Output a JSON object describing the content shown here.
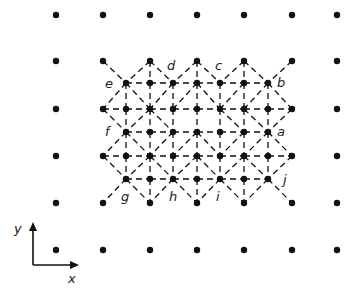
{
  "figure": {
    "width": 353,
    "height": 292,
    "colors": {
      "ink": "#111111",
      "background": "#ffffff"
    },
    "dot_radius": 3.2,
    "outer_lattice": {
      "columns": [
        56,
        103,
        150,
        197,
        244,
        292,
        337
      ],
      "rows": [
        15,
        61,
        109,
        156,
        203,
        250
      ],
      "excluded": [
        [
          150,
          109
        ],
        [
          197,
          109
        ],
        [
          244,
          109
        ],
        [
          150,
          156
        ],
        [
          197,
          156
        ],
        [
          244,
          156
        ]
      ]
    },
    "inner_lattice": {
      "rows": [
        {
          "y": 83,
          "xs": [
            126,
            150,
            173,
            197,
            220,
            244,
            268
          ]
        },
        {
          "y": 109,
          "xs": [
            126,
            150,
            173,
            197,
            220,
            244,
            268
          ]
        },
        {
          "y": 132,
          "xs": [
            126,
            150,
            173,
            197,
            220,
            244,
            268
          ]
        },
        {
          "y": 156,
          "xs": [
            126,
            150,
            173,
            197,
            220,
            244,
            268
          ]
        },
        {
          "y": 179,
          "xs": [
            126,
            150,
            173,
            197,
            220,
            244,
            268
          ]
        }
      ]
    },
    "edges": [
      [
        103,
        61,
        126,
        83
      ],
      [
        150,
        61,
        126,
        83
      ],
      [
        150,
        61,
        150,
        83
      ],
      [
        150,
        61,
        173,
        83
      ],
      [
        197,
        61,
        173,
        83
      ],
      [
        197,
        61,
        197,
        83
      ],
      [
        197,
        61,
        220,
        83
      ],
      [
        244,
        61,
        220,
        83
      ],
      [
        244,
        61,
        244,
        83
      ],
      [
        244,
        61,
        268,
        83
      ],
      [
        292,
        61,
        268,
        83
      ],
      [
        126,
        83,
        150,
        83
      ],
      [
        150,
        83,
        173,
        83
      ],
      [
        173,
        83,
        197,
        83
      ],
      [
        197,
        83,
        220,
        83
      ],
      [
        220,
        83,
        244,
        83
      ],
      [
        244,
        83,
        268,
        83
      ],
      [
        103,
        109,
        126,
        109
      ],
      [
        126,
        109,
        150,
        109
      ],
      [
        150,
        109,
        173,
        109
      ],
      [
        173,
        109,
        197,
        109
      ],
      [
        197,
        109,
        220,
        109
      ],
      [
        220,
        109,
        244,
        109
      ],
      [
        244,
        109,
        268,
        109
      ],
      [
        268,
        109,
        292,
        109
      ],
      [
        126,
        132,
        150,
        132
      ],
      [
        150,
        132,
        173,
        132
      ],
      [
        173,
        132,
        197,
        132
      ],
      [
        197,
        132,
        220,
        132
      ],
      [
        220,
        132,
        244,
        132
      ],
      [
        244,
        132,
        268,
        132
      ],
      [
        103,
        156,
        126,
        156
      ],
      [
        126,
        156,
        150,
        156
      ],
      [
        150,
        156,
        173,
        156
      ],
      [
        173,
        156,
        197,
        156
      ],
      [
        197,
        156,
        220,
        156
      ],
      [
        220,
        156,
        244,
        156
      ],
      [
        244,
        156,
        268,
        156
      ],
      [
        268,
        156,
        292,
        156
      ],
      [
        126,
        179,
        150,
        179
      ],
      [
        150,
        179,
        173,
        179
      ],
      [
        173,
        179,
        197,
        179
      ],
      [
        197,
        179,
        220,
        179
      ],
      [
        220,
        179,
        244,
        179
      ],
      [
        244,
        179,
        268,
        179
      ],
      [
        126,
        83,
        126,
        109
      ],
      [
        150,
        83,
        150,
        109
      ],
      [
        173,
        83,
        173,
        109
      ],
      [
        197,
        83,
        197,
        109
      ],
      [
        220,
        83,
        220,
        109
      ],
      [
        244,
        83,
        244,
        109
      ],
      [
        268,
        83,
        268,
        109
      ],
      [
        126,
        109,
        126,
        132
      ],
      [
        150,
        109,
        150,
        132
      ],
      [
        173,
        109,
        173,
        132
      ],
      [
        197,
        109,
        197,
        132
      ],
      [
        220,
        109,
        220,
        132
      ],
      [
        244,
        109,
        244,
        132
      ],
      [
        268,
        109,
        268,
        132
      ],
      [
        126,
        132,
        126,
        156
      ],
      [
        150,
        132,
        150,
        156
      ],
      [
        173,
        132,
        173,
        156
      ],
      [
        197,
        132,
        197,
        156
      ],
      [
        220,
        132,
        220,
        156
      ],
      [
        244,
        132,
        244,
        156
      ],
      [
        268,
        132,
        268,
        156
      ],
      [
        126,
        156,
        126,
        179
      ],
      [
        150,
        156,
        150,
        179
      ],
      [
        173,
        156,
        173,
        179
      ],
      [
        197,
        156,
        197,
        179
      ],
      [
        220,
        156,
        220,
        179
      ],
      [
        244,
        156,
        244,
        179
      ],
      [
        268,
        156,
        268,
        179
      ],
      [
        150,
        179,
        150,
        203
      ],
      [
        197,
        179,
        197,
        203
      ],
      [
        244,
        179,
        244,
        203
      ],
      [
        126,
        83,
        103,
        109
      ],
      [
        126,
        83,
        150,
        109
      ],
      [
        173,
        83,
        150,
        109
      ],
      [
        197,
        83,
        173,
        109
      ],
      [
        197,
        83,
        220,
        109
      ],
      [
        244,
        83,
        220,
        109
      ],
      [
        268,
        83,
        244,
        109
      ],
      [
        268,
        83,
        292,
        109
      ],
      [
        103,
        109,
        126,
        132
      ],
      [
        150,
        109,
        126,
        132
      ],
      [
        150,
        109,
        173,
        132
      ],
      [
        244,
        109,
        268,
        132
      ],
      [
        292,
        109,
        268,
        132
      ],
      [
        220,
        109,
        244,
        132
      ],
      [
        126,
        132,
        103,
        156
      ],
      [
        126,
        132,
        150,
        156
      ],
      [
        173,
        132,
        150,
        156
      ],
      [
        197,
        132,
        173,
        156
      ],
      [
        197,
        132,
        220,
        156
      ],
      [
        244,
        132,
        220,
        156
      ],
      [
        268,
        132,
        244,
        156
      ],
      [
        268,
        132,
        292,
        156
      ],
      [
        103,
        156,
        126,
        179
      ],
      [
        150,
        156,
        126,
        179
      ],
      [
        150,
        156,
        173,
        179
      ],
      [
        197,
        156,
        173,
        179
      ],
      [
        197,
        156,
        220,
        179
      ],
      [
        244,
        156,
        220,
        179
      ],
      [
        244,
        156,
        268,
        179
      ],
      [
        292,
        156,
        268,
        179
      ],
      [
        126,
        179,
        103,
        203
      ],
      [
        126,
        179,
        150,
        203
      ],
      [
        173,
        179,
        150,
        203
      ],
      [
        173,
        179,
        197,
        203
      ],
      [
        220,
        179,
        197,
        203
      ],
      [
        220,
        179,
        244,
        203
      ],
      [
        268,
        179,
        244,
        203
      ],
      [
        268,
        179,
        292,
        203
      ]
    ],
    "labels": [
      {
        "text": "a",
        "x": 277,
        "y": 136
      },
      {
        "text": "b",
        "x": 277,
        "y": 87
      },
      {
        "text": "c",
        "x": 215,
        "y": 70
      },
      {
        "text": "d",
        "x": 167,
        "y": 70
      },
      {
        "text": "e",
        "x": 105,
        "y": 88
      },
      {
        "text": "f",
        "x": 105,
        "y": 136
      },
      {
        "text": "g",
        "x": 121,
        "y": 201
      },
      {
        "text": "h",
        "x": 169,
        "y": 201
      },
      {
        "text": "i",
        "x": 216,
        "y": 201
      },
      {
        "text": "j",
        "x": 283,
        "y": 184
      }
    ],
    "axes": {
      "origin": [
        33,
        265
      ],
      "x_end": [
        79,
        265
      ],
      "y_end": [
        33,
        222
      ],
      "x_label": {
        "text": "x",
        "x": 68,
        "y": 283
      },
      "y_label": {
        "text": "y",
        "x": 14,
        "y": 233
      }
    }
  }
}
